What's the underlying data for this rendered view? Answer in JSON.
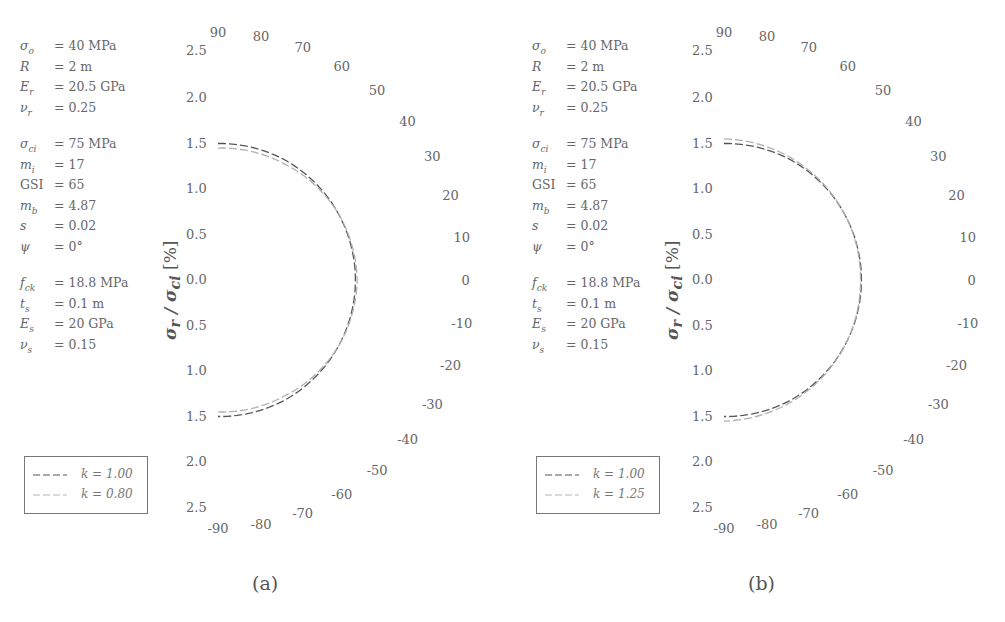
{
  "chart_data": [
    {
      "type": "line",
      "subtype": "polar-half (semicircular radial plot)",
      "panel": "(a)",
      "ylabel": "σr / σci [%]",
      "radial_ticks": [
        "2.5",
        "2.0",
        "1.5",
        "1.0",
        "0.5",
        "0.0",
        "0.5",
        "1.0",
        "1.5",
        "2.0",
        "2.5"
      ],
      "radial_range": [
        0,
        2.5
      ],
      "angle_ticks": [
        90,
        80,
        70,
        60,
        50,
        40,
        30,
        20,
        10,
        0,
        -10,
        -20,
        -30,
        -40,
        -50,
        -60,
        -70,
        -80,
        -90
      ],
      "angle_range_deg": [
        -90,
        90
      ],
      "parameters": [
        {
          "symbol": "σo",
          "value": "= 40 MPa"
        },
        {
          "symbol": "R",
          "value": "= 2 m"
        },
        {
          "symbol": "Er",
          "value": "= 20.5 GPa"
        },
        {
          "symbol": "νr",
          "value": "= 0.25"
        },
        {
          "symbol": "σci",
          "value": "= 75 MPa"
        },
        {
          "symbol": "mi",
          "value": "= 17"
        },
        {
          "symbol": "GSI",
          "value": "= 65"
        },
        {
          "symbol": "mb",
          "value": "= 4.87"
        },
        {
          "symbol": "s",
          "value": "= 0.02"
        },
        {
          "symbol": "ψ",
          "value": "= 0°"
        },
        {
          "symbol": "fck",
          "value": "= 18.8 MPa"
        },
        {
          "symbol": "ts",
          "value": "= 0.1 m"
        },
        {
          "symbol": "Es",
          "value": "= 20 GPa"
        },
        {
          "symbol": "νs",
          "value": "= 0.15"
        }
      ],
      "series": [
        {
          "name": "k = 1.00",
          "color": "#555555",
          "dash": "dashed",
          "theta_deg": [
            90,
            60,
            30,
            0,
            -30,
            -60,
            -90
          ],
          "r": [
            1.5,
            1.51,
            1.51,
            1.51,
            1.51,
            1.51,
            1.5
          ]
        },
        {
          "name": "k = 0.80",
          "color": "#b0b0b0",
          "dash": "dashed",
          "theta_deg": [
            90,
            60,
            30,
            0,
            -30,
            -60,
            -90
          ],
          "r": [
            1.45,
            1.47,
            1.51,
            1.53,
            1.51,
            1.47,
            1.45
          ]
        }
      ],
      "legend_position": "lower-left"
    },
    {
      "type": "line",
      "subtype": "polar-half (semicircular radial plot)",
      "panel": "(b)",
      "ylabel": "σr / σci [%]",
      "radial_ticks": [
        "2.5",
        "2.0",
        "1.5",
        "1.0",
        "0.5",
        "0.0",
        "0.5",
        "1.0",
        "1.5",
        "2.0",
        "2.5"
      ],
      "radial_range": [
        0,
        2.5
      ],
      "angle_ticks": [
        90,
        80,
        70,
        60,
        50,
        40,
        30,
        20,
        10,
        0,
        -10,
        -20,
        -30,
        -40,
        -50,
        -60,
        -70,
        -80,
        -90
      ],
      "angle_range_deg": [
        -90,
        90
      ],
      "parameters": [
        {
          "symbol": "σo",
          "value": "= 40 MPa"
        },
        {
          "symbol": "R",
          "value": "= 2 m"
        },
        {
          "symbol": "Er",
          "value": "= 20.5 GPa"
        },
        {
          "symbol": "νr",
          "value": "= 0.25"
        },
        {
          "symbol": "σci",
          "value": "= 75 MPa"
        },
        {
          "symbol": "mi",
          "value": "= 17"
        },
        {
          "symbol": "GSI",
          "value": "= 65"
        },
        {
          "symbol": "mb",
          "value": "= 4.87"
        },
        {
          "symbol": "s",
          "value": "= 0.02"
        },
        {
          "symbol": "ψ",
          "value": "= 0°"
        },
        {
          "symbol": "fck",
          "value": "= 18.8 MPa"
        },
        {
          "symbol": "ts",
          "value": "= 0.1 m"
        },
        {
          "symbol": "Es",
          "value": "= 20 GPa"
        },
        {
          "symbol": "νs",
          "value": "= 0.15"
        }
      ],
      "series": [
        {
          "name": "k = 1.00",
          "color": "#555555",
          "dash": "dashed",
          "theta_deg": [
            90,
            60,
            30,
            0,
            -30,
            -60,
            -90
          ],
          "r": [
            1.5,
            1.51,
            1.51,
            1.51,
            1.51,
            1.51,
            1.5
          ]
        },
        {
          "name": "k = 1.25",
          "color": "#b0b0b0",
          "dash": "dashed",
          "theta_deg": [
            90,
            60,
            30,
            0,
            -30,
            -60,
            -90
          ],
          "r": [
            1.55,
            1.53,
            1.51,
            1.5,
            1.51,
            1.53,
            1.55
          ]
        }
      ],
      "legend_position": "lower-left"
    }
  ],
  "panels": [
    {
      "caption": "(a)",
      "ylabel_main": "σ",
      "ylabel_sub1": "r",
      "ylabel_mid": " / σ",
      "ylabel_sub2": "ci",
      "ylabel_unit": " [%]",
      "legend": [
        {
          "label": "k = 1.00"
        },
        {
          "label": "k = 0.80"
        }
      ]
    },
    {
      "caption": "(b)",
      "ylabel_main": "σ",
      "ylabel_sub1": "r",
      "ylabel_mid": " / σ",
      "ylabel_sub2": "ci",
      "ylabel_unit": " [%]",
      "legend": [
        {
          "label": "k = 1.00"
        },
        {
          "label": "k = 1.25"
        }
      ]
    }
  ],
  "params_display": [
    {
      "sym": "σ",
      "sub": "o",
      "val": "= 40 MPa"
    },
    {
      "sym": "R",
      "sub": "",
      "val": "= 2 m"
    },
    {
      "sym": "E",
      "sub": "r",
      "val": "= 20.5 GPa"
    },
    {
      "sym": "ν",
      "sub": "r",
      "val": "= 0.25"
    },
    {
      "sym": "σ",
      "sub": "ci",
      "val": "= 75 MPa"
    },
    {
      "sym": "m",
      "sub": "i",
      "val": "= 17"
    },
    {
      "sym": "GSI",
      "sub": "",
      "val": "= 65"
    },
    {
      "sym": "m",
      "sub": "b",
      "val": "= 4.87"
    },
    {
      "sym": "s",
      "sub": "",
      "val": "= 0.02"
    },
    {
      "sym": "ψ",
      "sub": "",
      "val": "= 0°"
    },
    {
      "sym": "f",
      "sub": "ck",
      "val": "= 18.8 MPa"
    },
    {
      "sym": "t",
      "sub": "s",
      "val": "= 0.1 m"
    },
    {
      "sym": "E",
      "sub": "s",
      "val": "= 20 GPa"
    },
    {
      "sym": "ν",
      "sub": "s",
      "val": "= 0.15"
    }
  ],
  "colors": {
    "series_dark": "#555555",
    "series_light": "#b3b3b3",
    "text": "#555555",
    "legend_border": "#777777"
  }
}
